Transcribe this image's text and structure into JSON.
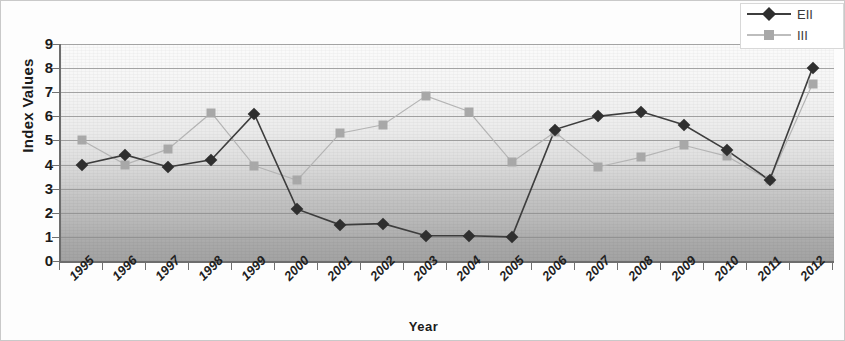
{
  "chart_data": {
    "type": "line",
    "title": "",
    "xlabel": "Year",
    "ylabel": "Index Values",
    "categories": [
      "1995",
      "1996",
      "1997",
      "1998",
      "1999",
      "2000",
      "2001",
      "2002",
      "2003",
      "2004",
      "2005",
      "2006",
      "2007",
      "2008",
      "2009",
      "2010",
      "2011",
      "2012"
    ],
    "ylim": [
      0,
      9
    ],
    "yticks": [
      0,
      1,
      2,
      3,
      4,
      5,
      6,
      7,
      8,
      9
    ],
    "grid": true,
    "legend_position": "top-right",
    "series": [
      {
        "name": "EII",
        "marker": "diamond",
        "color": "#2f2f2f",
        "line_color": "#3d3d3d",
        "values": [
          4.0,
          4.4,
          3.9,
          4.2,
          6.1,
          2.15,
          1.5,
          1.55,
          1.05,
          1.05,
          1.0,
          5.45,
          6.0,
          6.2,
          5.65,
          4.6,
          3.35,
          8.0
        ]
      },
      {
        "name": "III",
        "marker": "square",
        "color": "#a8a8a8",
        "line_color": "#b4b4b4",
        "values": [
          5.0,
          4.0,
          4.65,
          6.15,
          3.95,
          3.35,
          5.3,
          5.65,
          6.85,
          6.2,
          4.1,
          5.35,
          3.9,
          4.3,
          4.8,
          4.35,
          3.35,
          7.35
        ]
      }
    ]
  },
  "legend": {
    "entries": [
      {
        "label": "EII"
      },
      {
        "label": "III"
      }
    ]
  },
  "axis": {
    "y_title": "Index Values",
    "x_title": "Year"
  },
  "colors": {
    "series1": "#2f2f2f",
    "series2": "#a8a8a8",
    "grid": "#8a8a8a",
    "axis": "#6d6d6d",
    "text": "#1b1b1b"
  }
}
